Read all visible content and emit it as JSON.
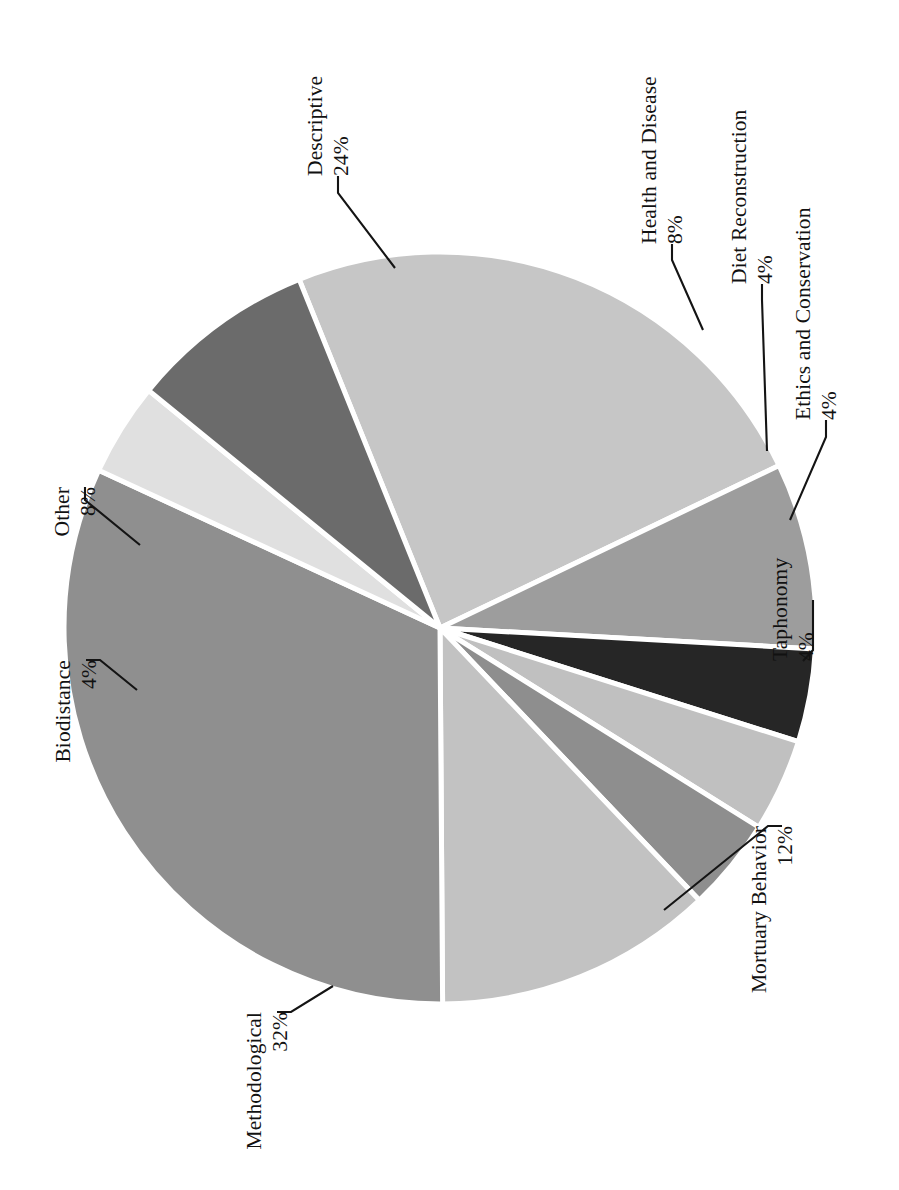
{
  "figure": {
    "background": "#ffffff",
    "rotation_degrees": 90,
    "note_orientation": "chart rendered rotated 90 degrees (labels read bottom-to-top)"
  },
  "chart_data": {
    "type": "pie",
    "title": "",
    "subtitle": "",
    "xlabel": "",
    "ylabel": "",
    "legend_position": "none",
    "grid": false,
    "labels_show_percent": true,
    "total_percent": 100,
    "categories": [
      "Descriptive",
      "Health and Disease",
      "Diet Reconstruction",
      "Ethics and Conservation",
      "Taphonomy",
      "Mortuary Behavior",
      "Methodological",
      "Biodistance",
      "Other"
    ],
    "values": [
      24,
      8,
      4,
      4,
      4,
      12,
      32,
      4,
      8
    ],
    "value_labels": [
      "24%",
      "8%",
      "4%",
      "4%",
      "4%",
      "12%",
      "32%",
      "4%",
      "8%"
    ],
    "colors": [
      "#c6c6c6",
      "#9d9d9d",
      "#262626",
      "#c0c0c0",
      "#8e8e8e",
      "#c2c2c2",
      "#8f8f8f",
      "#e0e0e0",
      "#6b6b6b"
    ],
    "slice_edge_color": "#ffffff",
    "label_color": "#111111",
    "slices": [
      {
        "name": "Descriptive",
        "percent": 24,
        "label": "Descriptive",
        "pct_label": "24%",
        "color": "#c6c6c6"
      },
      {
        "name": "Health and Disease",
        "percent": 8,
        "label": "Health and Disease",
        "pct_label": "8%",
        "color": "#9d9d9d"
      },
      {
        "name": "Diet Reconstruction",
        "percent": 4,
        "label": "Diet Reconstruction",
        "pct_label": "4%",
        "color": "#262626"
      },
      {
        "name": "Ethics and Conservation",
        "percent": 4,
        "label": "Ethics and Conservation",
        "pct_label": "4%",
        "color": "#c0c0c0"
      },
      {
        "name": "Taphonomy",
        "percent": 4,
        "label": "Taphonomy",
        "pct_label": "4%",
        "color": "#8e8e8e"
      },
      {
        "name": "Mortuary Behavior",
        "percent": 12,
        "label": "Mortuary Behavior",
        "pct_label": "12%",
        "color": "#c2c2c2"
      },
      {
        "name": "Methodological",
        "percent": 32,
        "label": "Methodological",
        "pct_label": "32%",
        "color": "#8f8f8f"
      },
      {
        "name": "Biodistance",
        "percent": 4,
        "label": "Biodistance",
        "pct_label": "4%",
        "color": "#e0e0e0"
      },
      {
        "name": "Other",
        "percent": 8,
        "label": "Other",
        "pct_label": "8%",
        "color": "#6b6b6b"
      }
    ]
  },
  "labels": {
    "descriptive_name": "Descriptive",
    "descriptive_pct": "24%",
    "health_name": "Health and Disease",
    "health_pct": "8%",
    "diet_name": "Diet Reconstruction",
    "diet_pct": "4%",
    "ethics_name": "Ethics and Conservation",
    "ethics_pct": "4%",
    "taphonomy_name": "Taphonomy",
    "taphonomy_pct": "4%",
    "mortuary_name": "Mortuary Behavior",
    "mortuary_pct": "12%",
    "methodological_name": "Methodological",
    "methodological_pct": "32%",
    "biodistance_name": "Biodistance",
    "biodistance_pct": "4%",
    "other_name": "Other",
    "other_pct": "8%"
  }
}
